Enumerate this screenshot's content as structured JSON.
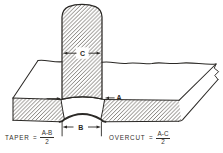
{
  "figure": {
    "dimension_labels": {
      "electrode_width": "C",
      "cavity_top_width": "A",
      "cavity_bottom_width": "B"
    },
    "formulas": {
      "taper": {
        "name": "TAPER",
        "equals": "=",
        "numerator": "A-B",
        "denominator": "2"
      },
      "overcut": {
        "name": "OVERCUT",
        "equals": "=",
        "numerator": "A-C",
        "denominator": "2"
      }
    },
    "colors": {
      "ink": "#2b2926",
      "hatch_lines": "#49453e",
      "background": "#ffffff"
    }
  }
}
